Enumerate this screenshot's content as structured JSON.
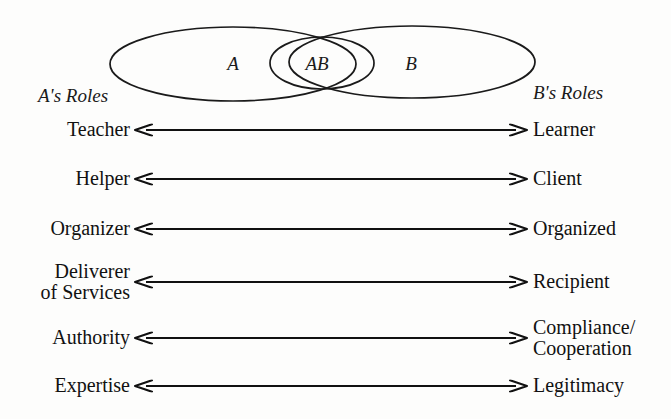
{
  "diagram": {
    "venn": {
      "region_a_label": "A",
      "region_ab_label": "AB",
      "region_b_label": "B"
    },
    "columns": {
      "left_header": "A's Roles",
      "right_header": "B's Roles"
    },
    "rows": [
      {
        "left": "Teacher",
        "right": "Learner",
        "y": 130
      },
      {
        "left": "Helper",
        "right": "Client",
        "y": 179
      },
      {
        "left": "Organizer",
        "right": "Organized",
        "y": 229
      },
      {
        "left": "Deliverer\nof Services",
        "right": "Recipient",
        "y": 282
      },
      {
        "left": "Authority",
        "right": "Compliance/\nCooperation",
        "y": 338
      },
      {
        "left": "Expertise",
        "right": "Legitimacy",
        "y": 386
      }
    ],
    "arrow": {
      "style": "double-headed",
      "left_x": 134,
      "right_x": 528
    },
    "colors": {
      "ink": "#111111",
      "paper": "#fdfdfc"
    }
  }
}
